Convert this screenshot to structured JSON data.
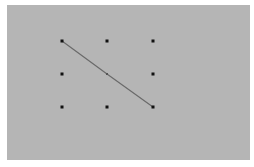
{
  "pattern_pad": {
    "background": "#b5b5b5",
    "dot_color": "#111111",
    "line_color": "#6a6a6a",
    "grid": {
      "rows": 3,
      "cols": 3,
      "dots": [
        {
          "row": 0,
          "col": 0,
          "x": 62,
          "y": 41,
          "selected": true
        },
        {
          "row": 0,
          "col": 1,
          "x": 107,
          "y": 41,
          "selected": false
        },
        {
          "row": 0,
          "col": 2,
          "x": 153,
          "y": 41,
          "selected": false
        },
        {
          "row": 1,
          "col": 0,
          "x": 62,
          "y": 74,
          "selected": false
        },
        {
          "row": 1,
          "col": 1,
          "x": 107,
          "y": 74,
          "selected": true
        },
        {
          "row": 1,
          "col": 2,
          "x": 153,
          "y": 74,
          "selected": false
        },
        {
          "row": 2,
          "col": 0,
          "x": 62,
          "y": 107,
          "selected": false
        },
        {
          "row": 2,
          "col": 1,
          "x": 107,
          "y": 107,
          "selected": false
        },
        {
          "row": 2,
          "col": 2,
          "x": 153,
          "y": 107,
          "selected": true
        }
      ]
    },
    "path": [
      [
        0,
        0
      ],
      [
        1,
        1
      ],
      [
        2,
        2
      ]
    ]
  }
}
